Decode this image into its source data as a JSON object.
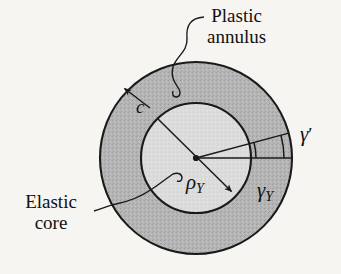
{
  "figure": {
    "background_color": "#f6f5f2",
    "stroke_color": "#1a1a1a",
    "annulus_fill": "#b4b4b4",
    "core_fill": "#dcdcdc",
    "center": {
      "x": 196,
      "y": 158
    },
    "outer_radius": 96,
    "inner_radius": 55
  },
  "labels": {
    "plastic_annulus": {
      "line1": "Plastic",
      "line2": "annulus",
      "name": "plastic-annulus-label"
    },
    "elastic_core": {
      "line1": "Elastic",
      "line2": "core",
      "name": "elastic-core-label"
    },
    "wall_thickness": {
      "symbol": "c",
      "name": "annulus-thickness-label"
    },
    "shear_strain_outer": {
      "symbol": "γ",
      "prime": "′",
      "name": "gamma-prime-label"
    },
    "shear_strain_yield": {
      "symbol": "γ",
      "subscript": "Y",
      "name": "gamma-yield-label"
    },
    "yield_radius": {
      "symbol": "ρ",
      "subscript": "Y",
      "name": "rho-yield-label"
    }
  },
  "geometry_notes": {
    "outer_circle": "plastic annulus outer boundary, radius c",
    "inner_circle": "elastic core boundary, radius rho-Y",
    "horizontal_radius": "reference radial line from center to outer circle (0 degrees)",
    "inclined_radius": "deformed radial line from center to outer circle (about 15 degrees above horizontal)",
    "diagonal_dimension": "rho-Y dimension line across the elastic core with arrowhead at lower right",
    "gamma_prime_arc": "arc measuring shear strain at the outer surface",
    "gamma_yield_arc": "arc measuring shear strain at the elastic-plastic boundary"
  }
}
